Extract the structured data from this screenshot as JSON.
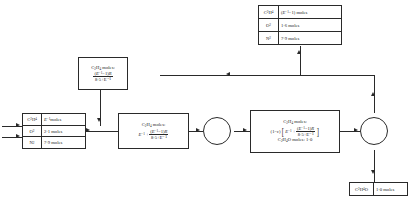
{
  "diagram": {
    "type": "process-flow-diagram"
  },
  "feed_table": {
    "name": "fresh-feed-stream",
    "rows": [
      {
        "species": "C2H4",
        "value": "E⁻¹ moles"
      },
      {
        "species": "O2",
        "value": "2·1 moles"
      },
      {
        "species": "N2",
        "value": "7·9 moles"
      }
    ]
  },
  "purge_table": {
    "name": "purge-stream",
    "rows": [
      {
        "species": "C2H4",
        "value": "(E⁻¹−1) moles"
      },
      {
        "species": "O2",
        "value": "1·6 moles"
      },
      {
        "species": "N2",
        "value": "7·9 moles"
      }
    ]
  },
  "product_table": {
    "name": "product-stream",
    "rows": [
      {
        "species": "C2H4O",
        "value": "1·0 moles"
      }
    ]
  },
  "recycle_box": {
    "label": "C2H4 moles:",
    "numerator": "(E⁻¹−1)R",
    "denominator": "8·5+E⁻¹"
  },
  "mixer_box": {
    "label": "C2H4 moles:",
    "lead": "E⁻¹ +",
    "numerator": "(E⁻¹−1)R",
    "denominator": "8·5+E⁻¹"
  },
  "reactor_box": {
    "label": "C2H4 moles:",
    "factor": "(1−ε)",
    "bracket_lead": "E⁻¹ +",
    "numerator": "(E⁻¹−1)R",
    "denominator": "8·5+E⁻¹",
    "product_line_species": "C2H4O moles:",
    "product_line_value": "1·0"
  },
  "nodes": {
    "mixer_label": "mixing-junction",
    "splitter_label": "splitter-junction"
  },
  "colors": {
    "line": "#2a2a2a",
    "background": "#ffffff"
  }
}
